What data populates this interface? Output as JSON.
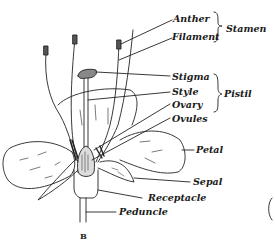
{
  "diagram": {
    "figure_label": "B",
    "labels": {
      "anther": "Anther",
      "filament": "Filament",
      "stigma": "Stigma",
      "style": "Style",
      "ovary": "Ovary",
      "ovules": "Ovules",
      "petal": "Petal",
      "sepal": "Sepal",
      "receptacle": "Receptacle",
      "peduncle": "Peduncle"
    },
    "groups": {
      "stamen": "Stamen",
      "pistil": "Pistil"
    },
    "colors": {
      "ink": "#1a1a1a",
      "background": "#ffffff"
    }
  }
}
